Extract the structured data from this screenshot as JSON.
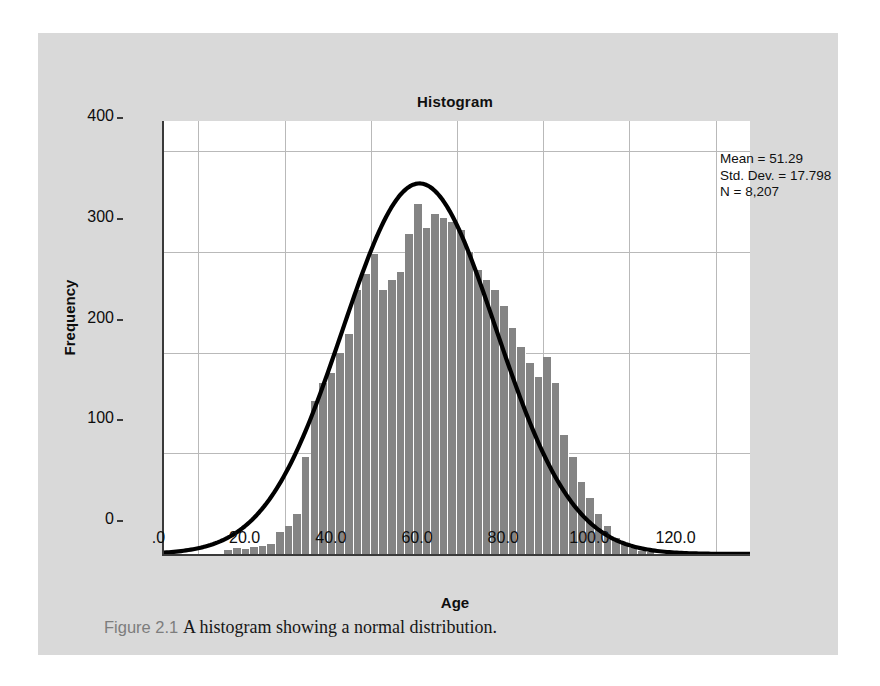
{
  "figure": {
    "caption_number": "Figure 2.1",
    "caption_text": "A histogram showing a normal distribution.",
    "panel_color": "#d9d9d9"
  },
  "statistics": {
    "mean_line": "Mean = 51.29",
    "std_dev_line": "Std. Dev. = 17.798",
    "n_line": "N = 8,207"
  },
  "chart_data": {
    "type": "bar",
    "title": "Histogram",
    "xlabel": "Age",
    "ylabel": "Frequency",
    "xlim": [
      -8,
      128
    ],
    "ylim": [
      0,
      430
    ],
    "xticks": [
      0,
      20,
      40,
      60,
      80,
      100,
      120
    ],
    "xtick_labels": [
      ".0",
      "20.0",
      "40.0",
      "60.0",
      "80.0",
      "100.0",
      "120.0"
    ],
    "yticks": [
      0,
      100,
      200,
      300,
      400
    ],
    "ytick_labels": [
      "0",
      "100",
      "200",
      "300",
      "400"
    ],
    "grid": true,
    "legend": "none",
    "bar_color": "#848484",
    "curve_color": "#000000",
    "bin_width": 2,
    "bin_starts": [
      6,
      8,
      10,
      12,
      14,
      16,
      18,
      20,
      22,
      24,
      26,
      28,
      30,
      32,
      34,
      36,
      38,
      40,
      42,
      44,
      46,
      48,
      50,
      52,
      54,
      56,
      58,
      60,
      62,
      64,
      66,
      68,
      70,
      72,
      74,
      76,
      78,
      80,
      82,
      84,
      86,
      88,
      90,
      92,
      94,
      96,
      98,
      100,
      102,
      104
    ],
    "values": [
      4,
      6,
      5,
      7,
      8,
      10,
      22,
      28,
      40,
      96,
      152,
      170,
      180,
      200,
      218,
      262,
      278,
      298,
      262,
      272,
      280,
      318,
      348,
      324,
      338,
      334,
      330,
      322,
      300,
      282,
      272,
      262,
      246,
      224,
      206,
      190,
      176,
      196,
      170,
      118,
      96,
      72,
      56,
      40,
      28,
      16,
      10,
      6,
      3,
      2
    ],
    "overlay_curve": {
      "kind": "normal",
      "mean": 51.29,
      "std_dev": 17.798,
      "n": 8207,
      "peak_value": 368
    }
  }
}
